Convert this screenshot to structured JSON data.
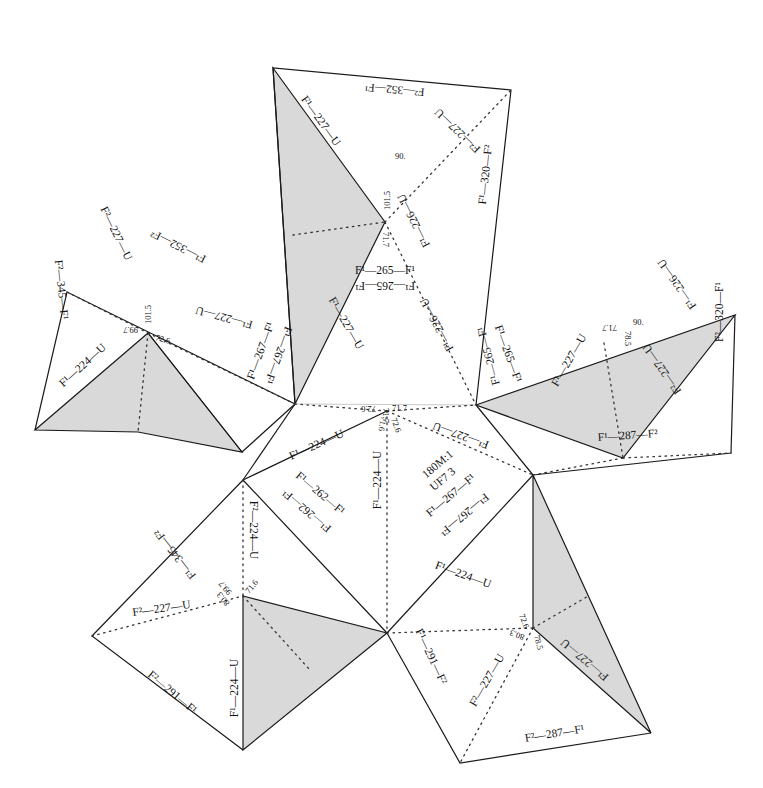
{
  "figure": {
    "type": "crystal-structure net (folding template)",
    "annotation": [
      "180M:1",
      "UF7 3"
    ]
  },
  "labels": {
    "top_quad_top": "F²—352—F¹",
    "top_shade_edge": "F¹—227—U",
    "top_fold_right": "F²—227—U",
    "top_right_edge": "F¹—320—F²",
    "top_fold_down": "F¹—226—U",
    "top_angle_1": "101.5",
    "top_angle_2": "90.",
    "top_angle_3": "71.7",
    "center_top_a": "F¹—265—F¹",
    "center_top_b": "F¹—265—F¹",
    "left_top_edge": "F¹—352—F²",
    "left_fold_up": "F²—227—U",
    "left_left_edge": "F²—345—F¹",
    "left_fold_right": "F¹—227—U",
    "left_shade_edge": "F¹—224—U",
    "left_angle_1": "99.7",
    "left_angle_2": "101.5",
    "left_angle_3": "72.6",
    "inner_left_a": "F¹—267—F¹",
    "inner_left_b": "F¹—267—F¹",
    "inner_fold_a": "F¹—227—U",
    "inner_fold_b": "F¹—226—U",
    "inner_right_a": "F¹—265—F¹",
    "inner_right_b": "F¹—265—F¹",
    "inner_bottom_edge": "F¹—224—U",
    "inner_fold_c": "F¹—227—U",
    "center_angle_1": "71.7",
    "center_angle_2": "71.7",
    "center_angle_3": "72.6",
    "center_angle_4": "71.6",
    "center_angle_5": "72.6",
    "right_shade_edge": "F¹—226—U",
    "right_right_edge": "F²—320—F¹",
    "right_fold_a": "F¹—227—U",
    "right_fold_b": "F²—227—U",
    "right_bottom_edge": "F¹—287—F²",
    "right_angle_1": "71.7",
    "right_angle_2": "90.",
    "right_angle_3": "78.5",
    "lower_mid_fold": "F¹—224—U",
    "lower_mid_edge_a": "F¹—262—F¹",
    "lower_mid_edge_b": "F¹—262—F¹",
    "lower_right_edge_a": "F¹—267—F¹",
    "lower_right_edge_b": "F¹—267—F¹",
    "bl_fold_up": "F²—224—U",
    "bl_edge_up": "F¹—345—F²",
    "bl_fold_left": "F²—227—U",
    "bl_edge_low": "F²—291—F¹",
    "bl_shade_edge": "F¹—224—U",
    "bl_angle_1": "99.7",
    "bl_angle_2": "71.6",
    "bl_angle_3": "80.3",
    "br_fold_a": "F¹—224—U",
    "br_edge_left": "F¹—291—F²",
    "br_fold_b": "F²—227—U",
    "br_shade_edge": "F¹—227—U",
    "br_bottom_edge": "F²—287—F¹",
    "br_angle_1": "72.6",
    "br_angle_2": "80.3",
    "br_angle_3": "78.5"
  },
  "colors": {
    "shade": "#d9d9d9",
    "line": "#1a1a1a",
    "background": "#ffffff"
  }
}
